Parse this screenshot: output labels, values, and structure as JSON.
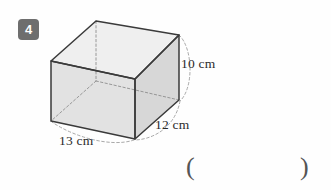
{
  "page": {
    "background_color": "#fefefe"
  },
  "question": {
    "number": "4",
    "badge_color": "#6e6e6e",
    "badge_text_color": "#ffffff"
  },
  "figure": {
    "name": "cuboid-diagram",
    "shape": "rectangular prism",
    "face_fill_front": "#e2e2e2",
    "face_fill_right": "#d6d6d6",
    "face_fill_top": "#efefef",
    "face_fill_left": "#ededed",
    "edge_color": "#3a3a3a",
    "hidden_edge_color": "#8f8f8f",
    "leader_color": "#9a9a9a"
  },
  "dimensions": [
    {
      "id": "height",
      "label": "10 cm",
      "value": 10,
      "unit": "cm"
    },
    {
      "id": "depth",
      "label": "12 cm",
      "value": 12,
      "unit": "cm"
    },
    {
      "id": "width",
      "label": "13 cm",
      "value": 13,
      "unit": "cm"
    }
  ],
  "answer": {
    "open_paren": "(",
    "close_paren": ")",
    "value": ""
  }
}
